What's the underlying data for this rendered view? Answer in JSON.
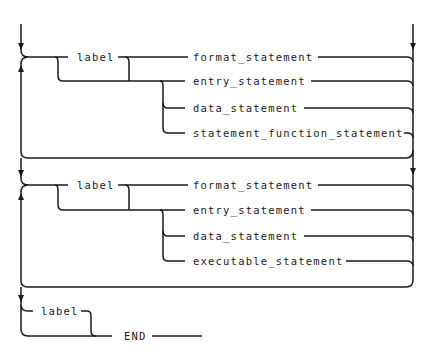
{
  "diagram": {
    "type": "syntax_railroad_diagram",
    "block1": {
      "label": "label",
      "alternatives": [
        "format_statement",
        "entry_statement",
        "data_statement",
        "statement_function_statement"
      ]
    },
    "block2": {
      "label": "label",
      "alternatives": [
        "format_statement",
        "entry_statement",
        "data_statement",
        "executable_statement"
      ]
    },
    "final": {
      "label": "label",
      "terminal": "END"
    }
  }
}
